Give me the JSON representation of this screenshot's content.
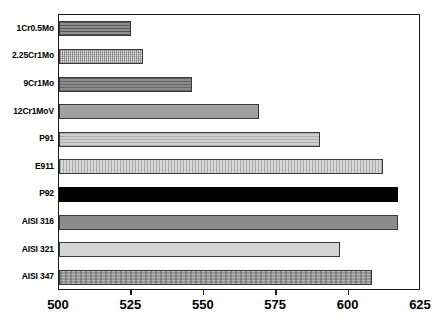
{
  "chart_data": {
    "type": "bar",
    "orientation": "horizontal",
    "title": "",
    "subtitle": "",
    "xlabel": "",
    "ylabel": "",
    "xlim": [
      500,
      625
    ],
    "ylim": null,
    "grid": false,
    "legend": null,
    "legend_position": "none",
    "xticks": [
      500,
      525,
      550,
      575,
      600,
      625
    ],
    "xtick_labels": [
      "500",
      "525",
      "550",
      "575",
      "600",
      "625"
    ],
    "categories": [
      "1Cr0.5Mo",
      "2.25Cr1Mo",
      "9Cr1Mo",
      "12Cr1MoV",
      "P91",
      "E911",
      "P92",
      "AISI 316",
      "AISI 321",
      "AISI 347"
    ],
    "values": [
      525,
      529,
      546,
      569,
      590,
      612,
      617,
      617,
      597,
      608
    ],
    "bars": [
      {
        "label": "1Cr0.5Mo",
        "value": 525,
        "fill": "dkgray-hline",
        "color": "#8e8e8e"
      },
      {
        "label": "2.25Cr1Mo",
        "value": 529,
        "fill": "checker-light",
        "color": "#e8e8e8"
      },
      {
        "label": "9Cr1Mo",
        "value": 546,
        "fill": "midgray-hline",
        "color": "#8a8a8a"
      },
      {
        "label": "12Cr1MoV",
        "value": 569,
        "fill": "solid-midgray",
        "color": "#a0a0a0"
      },
      {
        "label": "P91",
        "value": 590,
        "fill": "light-hline",
        "color": "#cfcfcf"
      },
      {
        "label": "E911",
        "value": 612,
        "fill": "light-vline",
        "color": "#d8d8d8"
      },
      {
        "label": "P92",
        "value": 617,
        "fill": "black",
        "color": "#000000"
      },
      {
        "label": "AISI 316",
        "value": 617,
        "fill": "solid-darkgray",
        "color": "#8c8c8c"
      },
      {
        "label": "AISI 321",
        "value": 597,
        "fill": "solid-lightgray",
        "color": "#d5d5d5"
      },
      {
        "label": "AISI 347",
        "value": 608,
        "fill": "texture-gray",
        "color": "#989898"
      }
    ],
    "axis_color": "#1a1a1a",
    "background_color": "#ffffff"
  }
}
